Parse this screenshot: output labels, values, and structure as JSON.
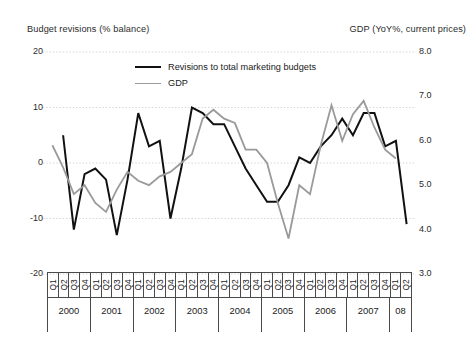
{
  "chart_data": {
    "type": "line",
    "title": "",
    "left_axis": {
      "label": "Budget revisions (% balance)",
      "ticks": [
        "20",
        "10",
        "0",
        "-10",
        "-20"
      ],
      "tick_values": [
        20,
        10,
        0,
        -10,
        -20
      ],
      "ylim": [
        -20,
        20
      ]
    },
    "right_axis": {
      "label": "GDP (YoY%, current prices)",
      "ticks": [
        "8.0",
        "7.0",
        "6.0",
        "5.0",
        "4.0",
        "3.0"
      ],
      "tick_values": [
        8.0,
        7.0,
        6.0,
        5.0,
        4.0,
        3.0
      ],
      "ylim": [
        3.0,
        8.0
      ]
    },
    "xlabel": "",
    "grid": true,
    "legend_position": "inside-top-center",
    "categories": [
      "2000 Q1",
      "2000 Q2",
      "2000 Q3",
      "2000 Q4",
      "2001 Q1",
      "2001 Q2",
      "2001 Q3",
      "2001 Q4",
      "2002 Q1",
      "2002 Q2",
      "2002 Q3",
      "2002 Q4",
      "2003 Q1",
      "2003 Q2",
      "2003 Q3",
      "2003 Q4",
      "2004 Q1",
      "2004 Q2",
      "2004 Q3",
      "2004 Q4",
      "2005 Q1",
      "2005 Q2",
      "2005 Q3",
      "2005 Q4",
      "2006 Q1",
      "2006 Q2",
      "2006 Q3",
      "2006 Q4",
      "2007 Q1",
      "2007 Q2",
      "2007 Q3",
      "2007 Q4",
      "2008 Q1",
      "2008 Q2"
    ],
    "years": [
      {
        "label": "2000",
        "quarters": [
          "Q1",
          "Q2",
          "Q3",
          "Q4"
        ]
      },
      {
        "label": "2001",
        "quarters": [
          "Q1",
          "Q2",
          "Q3",
          "Q4"
        ]
      },
      {
        "label": "2002",
        "quarters": [
          "Q1",
          "Q2",
          "Q3",
          "Q4"
        ]
      },
      {
        "label": "2003",
        "quarters": [
          "Q1",
          "Q2",
          "Q3",
          "Q4"
        ]
      },
      {
        "label": "2004",
        "quarters": [
          "Q1",
          "Q2",
          "Q3",
          "Q4"
        ]
      },
      {
        "label": "2005",
        "quarters": [
          "Q1",
          "Q2",
          "Q3",
          "Q4"
        ]
      },
      {
        "label": "2006",
        "quarters": [
          "Q1",
          "Q2",
          "Q3",
          "Q4"
        ]
      },
      {
        "label": "2007",
        "quarters": [
          "Q1",
          "Q2",
          "Q3",
          "Q4"
        ]
      },
      {
        "label": "08",
        "quarters": [
          "Q1",
          "Q2"
        ]
      }
    ],
    "series": [
      {
        "name": "Revisions to total marketing budgets",
        "axis": "left",
        "color": "#111111",
        "width": 2.0,
        "start_index": 1,
        "values": [
          null,
          5,
          -12,
          -2,
          -1,
          -3,
          -13,
          -3,
          9,
          3,
          4,
          -10,
          -1,
          10,
          9,
          7,
          7,
          3,
          -1,
          -4,
          -7,
          -7,
          -4,
          1,
          0,
          3,
          5,
          8,
          5,
          9,
          9,
          3,
          4,
          -11
        ]
      },
      {
        "name": "GDP",
        "axis": "right",
        "color": "#9a9a9a",
        "width": 1.8,
        "start_index": 0,
        "values": [
          5.9,
          5.4,
          4.8,
          5.0,
          4.6,
          4.4,
          4.9,
          5.3,
          5.1,
          5.0,
          5.2,
          5.3,
          5.5,
          5.7,
          6.5,
          6.7,
          6.5,
          6.4,
          5.8,
          5.8,
          5.5,
          4.6,
          3.8,
          5.0,
          4.8,
          5.9,
          6.8,
          6.0,
          6.6,
          6.9,
          6.3,
          5.8,
          5.6,
          null
        ]
      }
    ]
  },
  "legend": {
    "items": [
      {
        "label": "Revisions to total marketing budgets",
        "color": "#111111"
      },
      {
        "label": "GDP",
        "color": "#9a9a9a"
      }
    ]
  }
}
